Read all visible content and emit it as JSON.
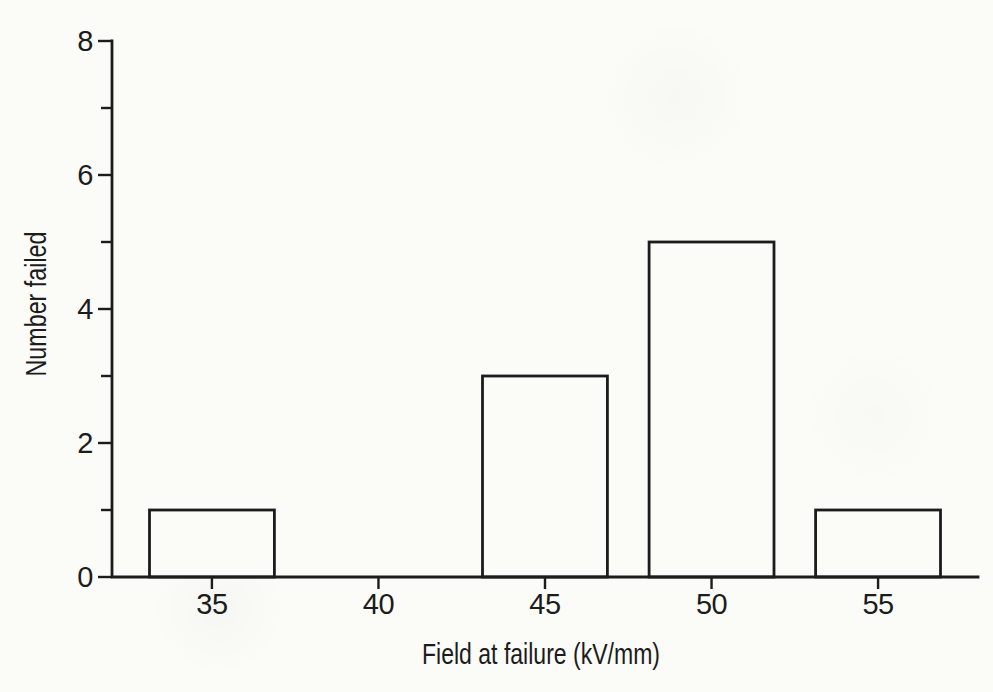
{
  "figure": {
    "ink": "#1c1c1c",
    "paper": "#fbfbf8"
  },
  "chart_data": {
    "type": "bar",
    "xlabel": "Field at failure (kV/mm)",
    "ylabel": "Number failed",
    "categories": [
      "35",
      "45",
      "50",
      "55"
    ],
    "values": [
      1,
      3,
      5,
      1
    ],
    "bars": [
      {
        "center": 35,
        "value": 1
      },
      {
        "center": 45,
        "value": 3
      },
      {
        "center": 50,
        "value": 5
      },
      {
        "center": 55,
        "value": 1
      }
    ],
    "bar_width_units": 3.75,
    "bar_fill": "#fbfbf8",
    "bar_edge": "#1c1c1c",
    "xlim": [
      32,
      58
    ],
    "ylim": [
      0,
      8
    ],
    "x_ticks": [
      35,
      40,
      45,
      50,
      55
    ],
    "y_ticks_major": [
      0,
      2,
      4,
      6,
      8
    ],
    "y_ticks_minor": [
      1,
      3,
      5,
      7
    ],
    "grid": false,
    "legend": "none"
  }
}
